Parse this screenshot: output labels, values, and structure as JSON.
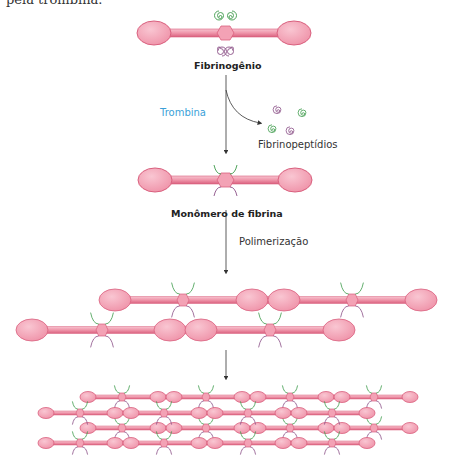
{
  "caption_fragment": "pela trombina.",
  "labels": {
    "fibrinogen": "Fibrinogênio",
    "thrombin": "Trombina",
    "fibrinopeptides": "Fibrinopeptídios",
    "fibrin_monomer": "Monômero de fibrina",
    "polymerization": "Polimerização"
  },
  "colors": {
    "globule_fill": "#f4a6b8",
    "globule_stroke": "#d9607e",
    "rod_fill": "#ee8ea5",
    "knob_green": "#3c9a4a",
    "knob_purple": "#8a4f86",
    "thrombin_text": "#3b9fd8",
    "arrow": "#333333"
  },
  "stages": [
    {
      "name": "fibrinogen",
      "description": "Fibrinogen molecule with 2 green and 2 purple fibrinopeptide spirals on central domain"
    },
    {
      "name": "cleavage",
      "description": "Thrombin cleaves 4 fibrinopeptides (2 green, 2 purple)"
    },
    {
      "name": "fibrin-monomer",
      "description": "Fibrin monomer with exposed binding knobs"
    },
    {
      "name": "polymerization-2-strands",
      "description": "Two staggered fibrin strands"
    },
    {
      "name": "polymerization-network",
      "description": "Four staggered strands forming fibrin network"
    }
  ]
}
